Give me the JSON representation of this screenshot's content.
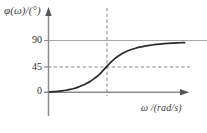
{
  "figure": {
    "background_color": "#ffffff",
    "width": 207,
    "height": 133
  },
  "chart_data": {
    "type": "line",
    "title": "",
    "subtitle": "",
    "xlabel": "ω /(rad/s)",
    "ylabel": "φ(ω)/(°)",
    "grid": false,
    "legend": null,
    "xlim": [
      0,
      10
    ],
    "ylim": [
      0,
      100
    ],
    "ytick_labels": [
      "0",
      "45",
      "90"
    ],
    "ytick_values": [
      0,
      45,
      90
    ],
    "xtick_labels": [],
    "xtick_values": [],
    "reference_lines": [
      {
        "name": "asymptote-90",
        "orientation": "horizontal",
        "value": 90,
        "label": "90",
        "style": "solid",
        "color": "#a8a8a8"
      },
      {
        "name": "level-45",
        "orientation": "horizontal",
        "value": 45,
        "label": "45",
        "style": "dashed",
        "color": "#7d7d7d"
      },
      {
        "name": "cutoff-frequency",
        "orientation": "vertical",
        "value": 4.2,
        "label": "",
        "style": "dashed",
        "color": "#7d7d7d"
      }
    ],
    "series": [
      {
        "name": "phase",
        "color": "#2b2b2b",
        "style": "solid",
        "x": [
          0.0,
          0.3,
          0.6,
          0.9,
          1.2,
          1.5,
          1.8,
          2.1,
          2.4,
          2.7,
          3.0,
          3.3,
          3.6,
          3.9,
          4.2,
          4.5,
          4.8,
          5.1,
          5.4,
          5.7,
          6.0,
          6.3,
          6.6,
          6.9,
          7.2,
          7.5,
          7.8,
          8.1,
          8.4,
          8.7,
          9.0,
          9.3,
          9.6,
          9.9
        ],
        "y": [
          0.6,
          1.0,
          1.6,
          2.4,
          3.4,
          4.8,
          6.5,
          8.8,
          11.6,
          15.0,
          19.2,
          24.0,
          29.6,
          37.0,
          45.0,
          52.4,
          58.8,
          64.0,
          68.2,
          71.6,
          74.4,
          76.6,
          78.4,
          79.9,
          81.2,
          82.2,
          83.1,
          83.8,
          84.4,
          84.9,
          85.4,
          85.8,
          86.1,
          86.4
        ]
      }
    ],
    "annotations": [
      {
        "name": "y-axis-arrow",
        "text": "",
        "kind": "arrow-head",
        "position": "top-of-y-axis"
      },
      {
        "name": "x-axis-arrow",
        "text": "",
        "kind": "arrow-head",
        "position": "right-of-x-axis"
      }
    ]
  },
  "axes": {
    "y_axis_label": "φ(ω)/(°)",
    "x_axis_label": "ω /(rad/s)",
    "axis_color": "#8c8c8c",
    "curve_color": "#2b2b2b",
    "tick_labels": {
      "y90": "90",
      "y45": "45",
      "y0": "0"
    }
  }
}
